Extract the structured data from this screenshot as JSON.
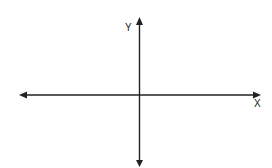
{
  "diagram": {
    "type": "cartesian-axes",
    "x_axis": {
      "label": "X",
      "arrows": "both"
    },
    "y_axis": {
      "label": "Y",
      "arrows": "both"
    },
    "stroke_color": "#222222",
    "background": "#ffffff"
  }
}
